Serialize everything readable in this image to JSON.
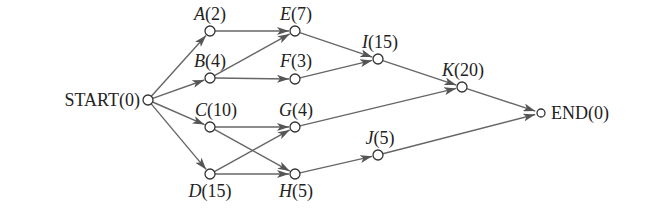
{
  "diagram": {
    "type": "activity-on-node network (PERT/CPM)",
    "nodes": [
      {
        "id": "START",
        "label": "START(0)",
        "name": "START",
        "duration": 0,
        "italic": false,
        "x": 148,
        "y": 100,
        "lx": 140,
        "ly": 106,
        "anchor": "end"
      },
      {
        "id": "A",
        "label": "A(2)",
        "name": "A",
        "duration": 2,
        "italic": true,
        "x": 210,
        "y": 31,
        "lx": 210,
        "ly": 20,
        "anchor": "middle"
      },
      {
        "id": "B",
        "label": "B(4)",
        "name": "B",
        "duration": 4,
        "italic": true,
        "x": 210,
        "y": 78,
        "lx": 210,
        "ly": 67,
        "anchor": "middle"
      },
      {
        "id": "C",
        "label": "C(10)",
        "name": "C",
        "duration": 10,
        "italic": true,
        "x": 210,
        "y": 127,
        "lx": 216,
        "ly": 116,
        "anchor": "middle"
      },
      {
        "id": "D",
        "label": "D(15)",
        "name": "D",
        "duration": 15,
        "italic": true,
        "x": 210,
        "y": 174,
        "lx": 210,
        "ly": 197,
        "anchor": "middle"
      },
      {
        "id": "E",
        "label": "E(7)",
        "name": "E",
        "duration": 7,
        "italic": true,
        "x": 295,
        "y": 31,
        "lx": 296,
        "ly": 20,
        "anchor": "middle"
      },
      {
        "id": "F",
        "label": "F(3)",
        "name": "F",
        "duration": 3,
        "italic": true,
        "x": 295,
        "y": 79,
        "lx": 296,
        "ly": 67,
        "anchor": "middle"
      },
      {
        "id": "G",
        "label": "G(4)",
        "name": "G",
        "duration": 4,
        "italic": true,
        "x": 295,
        "y": 127,
        "lx": 296,
        "ly": 116,
        "anchor": "middle"
      },
      {
        "id": "H",
        "label": "H(5)",
        "name": "H",
        "duration": 5,
        "italic": true,
        "x": 295,
        "y": 174,
        "lx": 296,
        "ly": 197,
        "anchor": "middle"
      },
      {
        "id": "I",
        "label": "I(15)",
        "name": "I",
        "duration": 15,
        "italic": true,
        "x": 378,
        "y": 59,
        "lx": 380,
        "ly": 48,
        "anchor": "middle"
      },
      {
        "id": "J",
        "label": "J(5)",
        "name": "J",
        "duration": 5,
        "italic": true,
        "x": 378,
        "y": 155,
        "lx": 380,
        "ly": 144,
        "anchor": "middle"
      },
      {
        "id": "K",
        "label": "K(20)",
        "name": "K",
        "duration": 20,
        "italic": true,
        "x": 462,
        "y": 87,
        "lx": 463,
        "ly": 76,
        "anchor": "middle"
      },
      {
        "id": "END",
        "label": "END(0)",
        "name": "END",
        "duration": 0,
        "italic": false,
        "x": 541,
        "y": 113,
        "lx": 551,
        "ly": 119,
        "anchor": "start"
      }
    ],
    "edges": [
      {
        "from": "START",
        "to": "A"
      },
      {
        "from": "START",
        "to": "B"
      },
      {
        "from": "START",
        "to": "C"
      },
      {
        "from": "START",
        "to": "D"
      },
      {
        "from": "A",
        "to": "E"
      },
      {
        "from": "B",
        "to": "E"
      },
      {
        "from": "B",
        "to": "F"
      },
      {
        "from": "C",
        "to": "G"
      },
      {
        "from": "C",
        "to": "H"
      },
      {
        "from": "D",
        "to": "G"
      },
      {
        "from": "D",
        "to": "H"
      },
      {
        "from": "E",
        "to": "I"
      },
      {
        "from": "F",
        "to": "I"
      },
      {
        "from": "G",
        "to": "K"
      },
      {
        "from": "I",
        "to": "K"
      },
      {
        "from": "H",
        "to": "J"
      },
      {
        "from": "K",
        "to": "END"
      },
      {
        "from": "J",
        "to": "END"
      }
    ],
    "colors": {
      "edge": "#666666",
      "node_stroke": "#333333",
      "text": "#222222",
      "background": "#ffffff"
    }
  }
}
